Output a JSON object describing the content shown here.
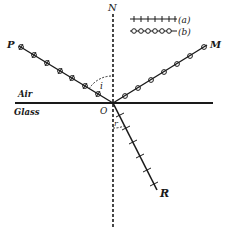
{
  "diagram": {
    "type": "refraction-reflection",
    "labels": {
      "normal": "N",
      "incident_point": "P",
      "reflected_point": "M",
      "refracted_point": "R",
      "origin": "O",
      "angle_incidence": "i",
      "angle_refraction": "r",
      "upper_medium": "Air",
      "lower_medium": "Glass"
    },
    "legend": [
      {
        "key": "a",
        "label": "(a)",
        "marker": "cross-ticks"
      },
      {
        "key": "b",
        "label": "(b)",
        "marker": "circles"
      }
    ],
    "colors": {
      "ink": "#1a1a1a",
      "background": "#ffffff"
    }
  }
}
